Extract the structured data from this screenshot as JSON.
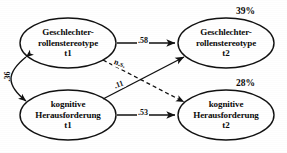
{
  "diagram": {
    "nodes": [
      {
        "id": "gs_t1",
        "lines": [
          "Geschlechter-",
          "rollenstereotype",
          "t1"
        ],
        "shape": "ellipse"
      },
      {
        "id": "gs_t2",
        "lines": [
          "Geschlechter-",
          "rollenstereotype",
          "t2"
        ],
        "shape": "ellipse",
        "variance_label": "39%"
      },
      {
        "id": "kh_t1",
        "lines": [
          "kognitive",
          "Herausforderung",
          "t1"
        ],
        "shape": "ellipse"
      },
      {
        "id": "kh_t2",
        "lines": [
          "kognitive",
          "Herausforderung",
          "t2"
        ],
        "shape": "ellipse",
        "variance_label": "28%"
      }
    ],
    "edges": [
      {
        "id": "gs_t1_to_gs_t2",
        "from": "gs_t1",
        "to": "gs_t2",
        "label": ".58",
        "style": "solid",
        "arrow": "single"
      },
      {
        "id": "kh_t1_to_kh_t2",
        "from": "kh_t1",
        "to": "kh_t2",
        "label": ".53",
        "style": "solid",
        "arrow": "single"
      },
      {
        "id": "kh_t1_to_gs_t2",
        "from": "kh_t1",
        "to": "gs_t2",
        "label": ".11",
        "style": "solid",
        "arrow": "single"
      },
      {
        "id": "gs_t1_to_kh_t2",
        "from": "gs_t1",
        "to": "kh_t2",
        "label": "n.s.",
        "style": "dashed",
        "arrow": "single"
      },
      {
        "id": "gs_t1_corr_kh_t1",
        "from": "gs_t1",
        "to": "kh_t1",
        "label": ".36",
        "style": "solid",
        "arrow": "double"
      }
    ],
    "colors": {
      "stroke": "#111111",
      "text": "#0b0b0b",
      "background": "#ffffff"
    }
  }
}
